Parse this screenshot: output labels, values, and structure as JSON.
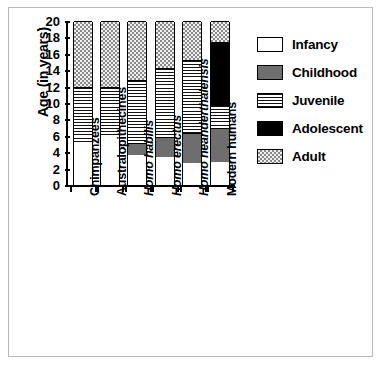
{
  "chart_data": {
    "type": "bar",
    "stacked": true,
    "title": "",
    "xlabel": "",
    "ylabel": "Age (in years)",
    "ylim": [
      0,
      20
    ],
    "ytick_values": [
      0,
      2,
      4,
      6,
      8,
      10,
      12,
      14,
      16,
      18,
      20
    ],
    "ytick_labels": [
      "0",
      "2",
      "4",
      "6",
      "8",
      "10",
      "12",
      "14",
      "16",
      "18",
      "20"
    ],
    "grid": false,
    "legend_position": "right",
    "categories": [
      "Chimpanzees",
      "Australopithecines",
      "Homo habilis",
      "Homo erectus",
      "Homo neanderthalensis",
      "Modern humans"
    ],
    "categories_italic": [
      false,
      false,
      true,
      true,
      true,
      false
    ],
    "series": [
      {
        "name": "Infancy",
        "color": "#ffffff",
        "pattern": "solid-white",
        "values": [
          5.0,
          6.0,
          3.6,
          3.4,
          2.7,
          2.8
        ]
      },
      {
        "name": "Childhood",
        "color": "#6e6e6e",
        "pattern": "solid-gray",
        "values": [
          0.0,
          0.0,
          1.5,
          2.5,
          3.7,
          4.1
        ]
      },
      {
        "name": "Juvenile",
        "color": "#ffffff",
        "pattern": "horizontal-lines",
        "values": [
          7.0,
          6.0,
          7.7,
          8.4,
          8.9,
          2.9
        ]
      },
      {
        "name": "Adolescent",
        "color": "#000000",
        "pattern": "solid-black",
        "values": [
          0.0,
          0.0,
          0.0,
          0.0,
          0.0,
          7.6
        ]
      },
      {
        "name": "Adult",
        "color": "#d8d8d8",
        "pattern": "checkered",
        "values": [
          8.0,
          8.0,
          7.2,
          5.7,
          4.7,
          2.6
        ]
      }
    ],
    "cumulative_boundaries": [
      [
        5.0,
        5.0,
        12.0,
        12.0,
        20.0
      ],
      [
        6.0,
        6.0,
        12.0,
        12.0,
        20.0
      ],
      [
        3.6,
        5.1,
        12.8,
        12.8,
        20.0
      ],
      [
        3.4,
        5.9,
        14.3,
        14.3,
        20.0
      ],
      [
        2.7,
        6.4,
        15.3,
        15.3,
        20.0
      ],
      [
        2.8,
        6.9,
        9.8,
        17.4,
        20.0
      ]
    ]
  },
  "legend": {
    "items": [
      {
        "label": "Infancy"
      },
      {
        "label": "Childhood"
      },
      {
        "label": "Juvenile"
      },
      {
        "label": "Adolescent"
      },
      {
        "label": "Adult"
      }
    ]
  }
}
